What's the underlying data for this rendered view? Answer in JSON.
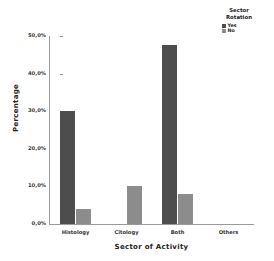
{
  "chart_data": {
    "type": "bar",
    "title": "",
    "xlabel": "Sector of Activity",
    "ylabel": "Percentage",
    "categories": [
      "Histology",
      "Citology",
      "Both",
      "Others"
    ],
    "series": [
      {
        "name": "Yes",
        "color": "#4d4d4d",
        "values": [
          30.0,
          0.0,
          47.5,
          0.0
        ]
      },
      {
        "name": "No",
        "color": "#8c8c8c",
        "values": [
          4.0,
          10.0,
          8.0,
          0.0
        ]
      }
    ],
    "ylim": [
      0,
      50
    ],
    "yticks": [
      0,
      10,
      20,
      30,
      40,
      50
    ],
    "ytick_labels": [
      "0,0%",
      "10,0%",
      "20,0%",
      "30,0%",
      "40,0%",
      "50,0%"
    ],
    "grid": false,
    "legend": {
      "title_line1": "Sector",
      "title_line2": "Rotation",
      "position": "top-right",
      "entries": [
        {
          "label": "Yes",
          "color": "#4d4d4d"
        },
        {
          "label": "No",
          "color": "#8c8c8c"
        }
      ]
    }
  }
}
